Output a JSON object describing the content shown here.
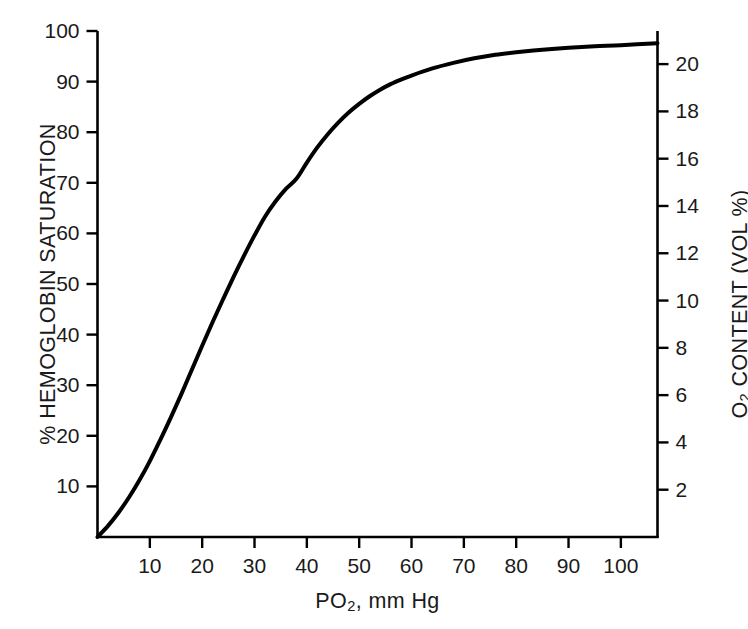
{
  "chart_data": {
    "type": "line",
    "title": "",
    "xlabel": "PO2, mm Hg",
    "ylabel": "% HEMOGLOBIN SATURATION",
    "ylabel_right": "O2 CONTENT (VOL %)",
    "xlim": [
      0,
      107
    ],
    "ylim": [
      0,
      100
    ],
    "ylim_right": [
      0,
      21.4
    ],
    "grid": false,
    "legend": null,
    "xticks": [
      10,
      20,
      30,
      40,
      50,
      60,
      70,
      80,
      90,
      100
    ],
    "xtick_labels": [
      "10",
      "20",
      "30",
      "40",
      "50",
      "60",
      "70",
      "80",
      "90",
      "100"
    ],
    "yticks_left": [
      10,
      20,
      30,
      40,
      50,
      60,
      70,
      80,
      90,
      100
    ],
    "ytick_labels_left": [
      "10",
      "20",
      "30",
      "40",
      "50",
      "60",
      "70",
      "80",
      "90",
      "100"
    ],
    "yticks_right": [
      2,
      4,
      6,
      8,
      10,
      12,
      14,
      16,
      18,
      20
    ],
    "ytick_labels_right": [
      "2",
      "4",
      "6",
      "8",
      "10",
      "12",
      "14",
      "16",
      "18",
      "20"
    ],
    "series": [
      {
        "name": "Oxyhemoglobin dissociation curve",
        "color": "#000000",
        "linewidth": 4,
        "x": [
          0,
          2,
          4,
          6,
          8,
          10,
          12,
          14,
          16,
          18,
          20,
          22,
          24,
          26,
          28,
          30,
          32,
          34,
          36,
          38,
          40,
          42,
          44,
          46,
          48,
          50,
          52,
          54,
          56,
          58,
          60,
          64,
          68,
          72,
          76,
          80,
          85,
          90,
          95,
          100,
          107
        ],
        "y": [
          0,
          2.2,
          4.8,
          7.8,
          11.2,
          15.0,
          19.2,
          23.6,
          28.2,
          33.0,
          37.8,
          42.5,
          47.0,
          51.4,
          55.6,
          59.6,
          63.3,
          66.3,
          68.8,
          70.8,
          74.0,
          77.0,
          79.6,
          81.9,
          83.9,
          85.6,
          87.1,
          88.4,
          89.5,
          90.4,
          91.2,
          92.6,
          93.7,
          94.6,
          95.3,
          95.8,
          96.3,
          96.7,
          97.0,
          97.2,
          97.6
        ]
      }
    ]
  },
  "figure": {
    "axis_color": "#000000",
    "background": "#ffffff",
    "xlabel_text": "PO",
    "xlabel_sub": "2",
    "xlabel_tail": ", mm Hg",
    "ylabel_left_text": "% HEMOGLOBIN SATURATION",
    "ylabel_right_text": "O",
    "ylabel_right_sub": "2",
    "ylabel_right_tail": " CONTENT (VOL %)"
  }
}
